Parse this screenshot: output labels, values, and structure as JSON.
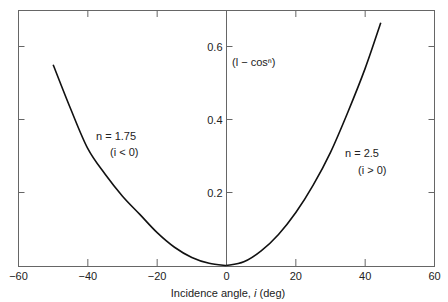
{
  "chart_data": {
    "type": "line",
    "title": "",
    "xlabel": "Incidence angle, i (deg)",
    "xlabel_prefix": "Incidence angle, ",
    "xlabel_var": "i",
    "xlabel_suffix": " (deg)",
    "ylabel": "(l − cosⁿ)",
    "xlim": [
      -60,
      60
    ],
    "ylim": [
      0,
      0.7
    ],
    "x_ticks": [
      "-60",
      "-40",
      "-20",
      "0",
      "20",
      "40",
      "60"
    ],
    "x_tick_labels": [
      "−60",
      "−40",
      "−20",
      "0",
      "20",
      "40",
      "60"
    ],
    "y_ticks": [
      0.2,
      0.4,
      0.6
    ],
    "y_tick_labels": [
      "0.2",
      "0.4",
      "0.6"
    ],
    "grid": false,
    "series": [
      {
        "name": "n = 1.75 (i < 0)",
        "x": [
          -50,
          -45,
          -40,
          -35,
          -30,
          -25,
          -20,
          -15,
          -10,
          -5,
          0
        ],
        "y": [
          0.55,
          0.43,
          0.32,
          0.25,
          0.19,
          0.14,
          0.09,
          0.05,
          0.022,
          0.006,
          0
        ]
      },
      {
        "name": "n = 2.5 (i > 0)",
        "x": [
          0,
          5,
          10,
          15,
          20,
          25,
          30,
          35,
          40,
          44.5
        ],
        "y": [
          0,
          0.01,
          0.04,
          0.085,
          0.145,
          0.22,
          0.31,
          0.42,
          0.54,
          0.665
        ]
      }
    ],
    "annotations": [
      {
        "text": "n = 1.75",
        "x": -35,
        "y": 0.35
      },
      {
        "text": "(i < 0)",
        "x": -31,
        "y": 0.31
      },
      {
        "text": "n = 2.5",
        "x": 31,
        "y": 0.3
      },
      {
        "text": "(i > 0)",
        "x": 32,
        "y": 0.25
      },
      {
        "text": "(l − cosⁿ)",
        "x": 1,
        "y": 0.57
      }
    ]
  },
  "labels": {
    "left_n": "n = 1.75",
    "left_cond": "(i < 0)",
    "right_n": "n = 2.5",
    "right_cond": "(i > 0)",
    "ylabel": "(l − cosⁿ)"
  }
}
